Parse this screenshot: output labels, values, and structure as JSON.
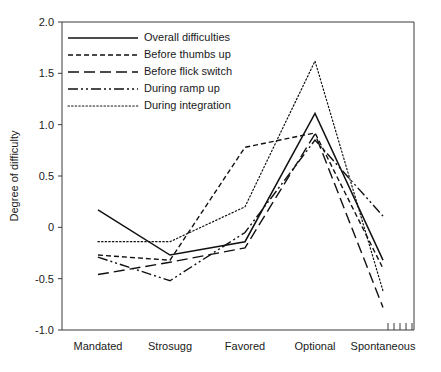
{
  "chart_data": {
    "type": "line",
    "title": "",
    "xlabel": "",
    "ylabel": "Degree of difficulty",
    "categories": [
      "Mandated",
      "Strosugg",
      "Favored",
      "Optional",
      "Spontaneous"
    ],
    "ylim": [
      -1.0,
      2.0
    ],
    "ytick_labels": [
      "2.0",
      "1.5",
      "1.0",
      "0.5",
      "0",
      "-0.5",
      "-1.0"
    ],
    "ytick_values": [
      2.0,
      1.5,
      1.0,
      0.5,
      0,
      -0.5,
      -1.0
    ],
    "grid": false,
    "legend_position": "top-left",
    "extra_minor_ticks_count": 5,
    "series": [
      {
        "name": "Overall difficulties",
        "style": "solid",
        "color": "#111111",
        "values": [
          0.17,
          -0.27,
          -0.14,
          1.11,
          -0.32
        ]
      },
      {
        "name": "Before thumbs up",
        "style": "short-dash",
        "color": "#111111",
        "values": [
          -0.27,
          -0.32,
          0.78,
          0.92,
          -0.4
        ]
      },
      {
        "name": "Before flick switch",
        "style": "long-dash",
        "color": "#111111",
        "values": [
          -0.46,
          -0.34,
          -0.2,
          0.91,
          -0.78
        ]
      },
      {
        "name": "During ramp up",
        "style": "dash-dot-dot",
        "color": "#111111",
        "values": [
          -0.29,
          -0.52,
          -0.05,
          0.85,
          0.11
        ]
      },
      {
        "name": "During integration",
        "style": "dotted",
        "color": "#111111",
        "values": [
          -0.14,
          -0.14,
          0.2,
          1.62,
          -0.62
        ]
      }
    ]
  }
}
